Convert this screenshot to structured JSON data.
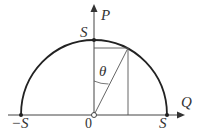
{
  "diagram": {
    "axis_vertical_label": "P",
    "axis_horizontal_label": "Q",
    "top_label": "S",
    "left_label": "−S",
    "right_label": "S",
    "origin_label": "0",
    "angle_label": "θ",
    "colors": {
      "stroke": "#333333",
      "arc": "#222222"
    }
  }
}
